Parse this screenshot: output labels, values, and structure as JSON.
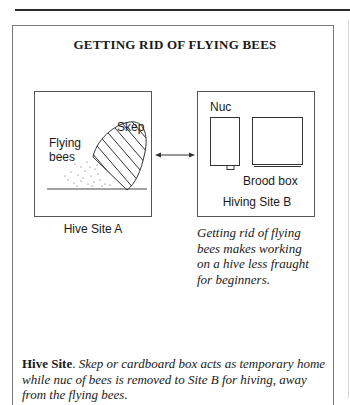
{
  "figure": {
    "title": "GETTING RID OF FLYING BEES",
    "site_a": {
      "labels": {
        "flying_bees_line1": "Flying",
        "flying_bees_line2": "bees",
        "skep": "Skep"
      },
      "caption": "Hive Site A"
    },
    "site_b": {
      "labels": {
        "nuc": "Nuc",
        "brood_box": "Brood box",
        "site": "Hiving Site B"
      }
    },
    "side_caption": {
      "line1": "Getting rid of flying",
      "line2": "bees makes working",
      "line3": "on a hive less fraught",
      "line4": "for beginners."
    },
    "bottom_caption": {
      "bold_lead": "Hive Site",
      "period": ".",
      "line1": " Skep or cardboard box acts as temporary home",
      "line2": "while nuc of bees is removed to Site B for hiving, away",
      "line3": "from the flying bees."
    }
  }
}
